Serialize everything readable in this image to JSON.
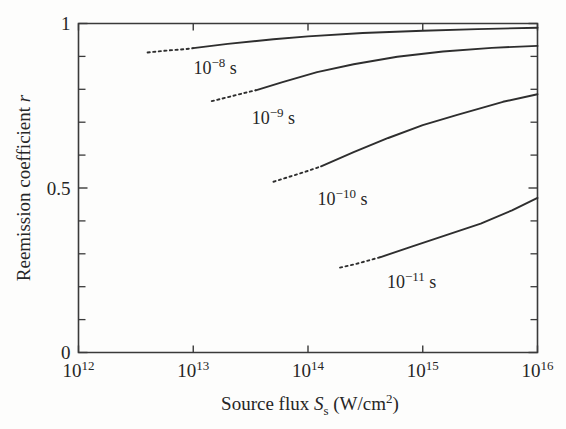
{
  "chart_data": {
    "type": "line",
    "title": "",
    "xlabel": "Source flux S_s (W/cm^2)",
    "xlabel_parts": {
      "text_before": "Source flux ",
      "symbol": "S",
      "subscript": "s",
      "units": " (W/cm",
      "units_sup": "2",
      "units_close": ")"
    },
    "ylabel": "Reemission coefficient r",
    "ylabel_parts": {
      "text": "Reemission coefficient ",
      "symbol": "r"
    },
    "xscale": "log",
    "yscale": "linear",
    "xlim": [
      1000000000000.0,
      1e+16
    ],
    "ylim": [
      0,
      1
    ],
    "grid": false,
    "legend_position": "inline-annotations",
    "x_major_ticks": [
      {
        "value": 1000000000000.0,
        "label_mantissa": "10",
        "label_exponent": "12"
      },
      {
        "value": 10000000000000.0,
        "label_mantissa": "10",
        "label_exponent": "13"
      },
      {
        "value": 100000000000000.0,
        "label_mantissa": "10",
        "label_exponent": "14"
      },
      {
        "value": 1000000000000000.0,
        "label_mantissa": "10",
        "label_exponent": "15"
      },
      {
        "value": 1e+16,
        "label_mantissa": "10",
        "label_exponent": "16"
      }
    ],
    "y_major_ticks": [
      {
        "value": 0,
        "label": "0"
      },
      {
        "value": 0.5,
        "label": "0.5"
      },
      {
        "value": 1,
        "label": "1"
      }
    ],
    "y_minor_ticks": [
      0.1,
      0.2,
      0.3,
      0.4,
      0.6,
      0.7,
      0.8,
      0.9
    ],
    "series": [
      {
        "name": "10^-8 s",
        "label_mantissa": "10",
        "label_exponent": "−8",
        "label_unit": " s",
        "label_x": 15500000000000.0,
        "label_y": 0.845,
        "dashed_points": [
          {
            "x": 4000000000000.0,
            "y": 0.912
          },
          {
            "x": 6000000000000.0,
            "y": 0.918
          },
          {
            "x": 8500000000000.0,
            "y": 0.922
          },
          {
            "x": 10000000000000.0,
            "y": 0.925
          }
        ],
        "solid_points": [
          {
            "x": 10000000000000.0,
            "y": 0.925
          },
          {
            "x": 20000000000000.0,
            "y": 0.938
          },
          {
            "x": 50000000000000.0,
            "y": 0.952
          },
          {
            "x": 100000000000000.0,
            "y": 0.961
          },
          {
            "x": 300000000000000.0,
            "y": 0.971
          },
          {
            "x": 1000000000000000.0,
            "y": 0.978
          },
          {
            "x": 3000000000000000.0,
            "y": 0.983
          },
          {
            "x": 1e+16,
            "y": 0.987
          }
        ]
      },
      {
        "name": "10^-9 s",
        "label_mantissa": "10",
        "label_exponent": "−9",
        "label_unit": " s",
        "label_x": 50000000000000.0,
        "label_y": 0.695,
        "dashed_points": [
          {
            "x": 14500000000000.0,
            "y": 0.764
          },
          {
            "x": 20000000000000.0,
            "y": 0.776
          },
          {
            "x": 28000000000000.0,
            "y": 0.789
          },
          {
            "x": 35000000000000.0,
            "y": 0.797
          }
        ],
        "solid_points": [
          {
            "x": 35000000000000.0,
            "y": 0.797
          },
          {
            "x": 60000000000000.0,
            "y": 0.822
          },
          {
            "x": 120000000000000.0,
            "y": 0.852
          },
          {
            "x": 250000000000000.0,
            "y": 0.876
          },
          {
            "x": 600000000000000.0,
            "y": 0.899
          },
          {
            "x": 1500000000000000.0,
            "y": 0.915
          },
          {
            "x": 4000000000000000.0,
            "y": 0.926
          },
          {
            "x": 1e+16,
            "y": 0.932
          }
        ]
      },
      {
        "name": "10^-10 s",
        "label_mantissa": "10",
        "label_exponent": "−10",
        "label_unit": " s",
        "label_x": 200000000000000.0,
        "label_y": 0.447,
        "dashed_points": [
          {
            "x": 50000000000000.0,
            "y": 0.519
          },
          {
            "x": 70000000000000.0,
            "y": 0.535
          },
          {
            "x": 100000000000000.0,
            "y": 0.552
          },
          {
            "x": 130000000000000.0,
            "y": 0.566
          }
        ],
        "solid_points": [
          {
            "x": 130000000000000.0,
            "y": 0.566
          },
          {
            "x": 250000000000000.0,
            "y": 0.609
          },
          {
            "x": 500000000000000.0,
            "y": 0.652
          },
          {
            "x": 1000000000000000.0,
            "y": 0.691
          },
          {
            "x": 2000000000000000.0,
            "y": 0.722
          },
          {
            "x": 5000000000000000.0,
            "y": 0.762
          },
          {
            "x": 1e+16,
            "y": 0.785
          }
        ]
      },
      {
        "name": "10^-11 s",
        "label_mantissa": "10",
        "label_exponent": "−11",
        "label_unit": " s",
        "label_x": 800000000000000.0,
        "label_y": 0.197,
        "dashed_points": [
          {
            "x": 190000000000000.0,
            "y": 0.258
          },
          {
            "x": 260000000000000.0,
            "y": 0.269
          },
          {
            "x": 340000000000000.0,
            "y": 0.28
          },
          {
            "x": 430000000000000.0,
            "y": 0.29
          }
        ],
        "solid_points": [
          {
            "x": 430000000000000.0,
            "y": 0.29
          },
          {
            "x": 800000000000000.0,
            "y": 0.322
          },
          {
            "x": 1600000000000000.0,
            "y": 0.357
          },
          {
            "x": 3200000000000000.0,
            "y": 0.392
          },
          {
            "x": 6000000000000000.0,
            "y": 0.432
          },
          {
            "x": 1e+16,
            "y": 0.47
          }
        ]
      }
    ]
  },
  "colors": {
    "axis": "#3a3a3a",
    "curve": "#2e2e2e",
    "text": "#262626",
    "background": "#fdfdfc"
  }
}
